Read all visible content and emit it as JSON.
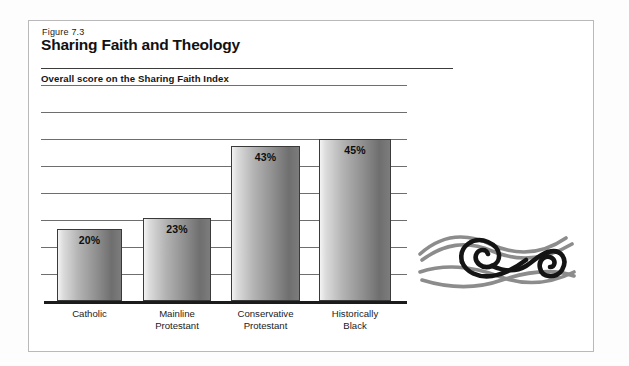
{
  "figure": {
    "number": "Figure 7.3",
    "title": "Sharing Faith and Theology",
    "subtitle": "Overall score on the Sharing Faith Index"
  },
  "ornament": {
    "name": "brush-spiral-ornament"
  },
  "chart_data": {
    "type": "bar",
    "title": "Sharing Faith and Theology",
    "subtitle": "Overall score on the Sharing Faith Index",
    "xlabel": "",
    "ylabel": "",
    "ylim": [
      0,
      60
    ],
    "grid": true,
    "gridline_values": [
      7.5,
      15,
      22.5,
      30,
      37.5,
      45,
      52.5,
      60
    ],
    "legend": "none",
    "categories": [
      "Catholic",
      "Mainline\nProtestant",
      "Conservative\nProtestant",
      "Historically\nBlack"
    ],
    "category_lines": [
      [
        "Catholic",
        ""
      ],
      [
        "Mainline",
        "Protestant"
      ],
      [
        "Conservative",
        "Protestant"
      ],
      [
        "Historically",
        "Black"
      ]
    ],
    "values": [
      20,
      23,
      43,
      45
    ],
    "value_labels": [
      "20%",
      "23%",
      "43%",
      "45%"
    ]
  },
  "colors": {
    "frame": "#b9b9b9",
    "rule": "#3c3c3c",
    "gridline": "#6e6e6e",
    "axis": "#1b1b1b",
    "bar_light": "#f3f3f3",
    "bar_dark": "#6f6f6f",
    "text": "#111111"
  }
}
